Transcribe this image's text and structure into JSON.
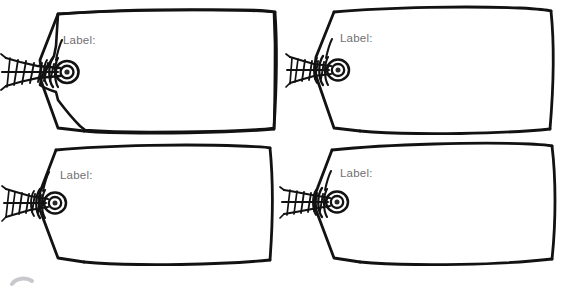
{
  "page": {
    "kind": "hand-drawn-gift-tag-template-sheet",
    "background_color": "#ffffff",
    "ink_color": "#121212",
    "label_text_color": "#6f6f73",
    "artifact_color": "#c9c9cd",
    "layout": "2x2 grid of four identical blank tags"
  },
  "tags": [
    {
      "id": "tag-top-left",
      "label": "Label:",
      "position": "top-left",
      "has_grommet": true,
      "has_twine": true
    },
    {
      "id": "tag-top-right",
      "label": "Label:",
      "position": "top-right",
      "has_grommet": true,
      "has_twine": true
    },
    {
      "id": "tag-bottom-left",
      "label": "Label:",
      "position": "bottom-left",
      "has_grommet": true,
      "has_twine": true
    },
    {
      "id": "tag-bottom-right",
      "label": "Label:",
      "position": "bottom-right",
      "has_grommet": true,
      "has_twine": true
    }
  ],
  "icons": {
    "grommet": "grommet-eyelet-icon",
    "twine": "braided-twine-knot-icon",
    "tag_body": "tag-outline-icon",
    "artifact": "partial-gray-arc-icon"
  }
}
